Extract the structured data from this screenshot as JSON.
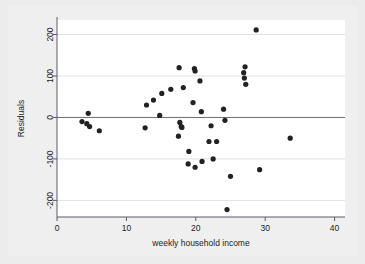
{
  "figure": {
    "background_color": "#ececec",
    "plot_background_color": "#ffffff",
    "point_color": "#222222",
    "grid_color": "#e2e2e2",
    "axis_color": "#5a5a6a",
    "zero_line_color": "#6b6b78"
  },
  "chart_data": {
    "type": "scatter",
    "title": "",
    "xlabel": "weekly household income",
    "ylabel": "Residuals",
    "xlim": [
      0,
      41.5
    ],
    "ylim": [
      -240,
      235
    ],
    "xticks": [
      0,
      10,
      20,
      30,
      40
    ],
    "xtick_labels": [
      "0",
      "10",
      "20",
      "30",
      "40"
    ],
    "yticks": [
      -200,
      -100,
      0,
      100,
      200
    ],
    "ytick_labels": [
      "-200",
      "-100",
      "0",
      "100",
      "200"
    ],
    "grid": true,
    "grid_axis": "y",
    "legend": false,
    "zero_reference_line": 0,
    "marker": "filled-circle",
    "marker_size": 2.6,
    "points": [
      {
        "x": 3.6,
        "y": -10
      },
      {
        "x": 4.5,
        "y": 10
      },
      {
        "x": 4.7,
        "y": -22
      },
      {
        "x": 4.3,
        "y": -15
      },
      {
        "x": 6.1,
        "y": -32
      },
      {
        "x": 12.7,
        "y": -25
      },
      {
        "x": 12.9,
        "y": 30
      },
      {
        "x": 13.9,
        "y": 42
      },
      {
        "x": 14.8,
        "y": 5
      },
      {
        "x": 15.1,
        "y": 58
      },
      {
        "x": 16.4,
        "y": 68
      },
      {
        "x": 17.6,
        "y": 120
      },
      {
        "x": 17.7,
        "y": -12
      },
      {
        "x": 17.9,
        "y": -22
      },
      {
        "x": 18.0,
        "y": -24
      },
      {
        "x": 17.5,
        "y": -45
      },
      {
        "x": 18.2,
        "y": 72
      },
      {
        "x": 19.0,
        "y": -82
      },
      {
        "x": 18.9,
        "y": -112
      },
      {
        "x": 19.8,
        "y": 118
      },
      {
        "x": 19.9,
        "y": 112
      },
      {
        "x": 19.6,
        "y": 36
      },
      {
        "x": 19.9,
        "y": -120
      },
      {
        "x": 20.6,
        "y": 88
      },
      {
        "x": 20.8,
        "y": 14
      },
      {
        "x": 20.9,
        "y": -106
      },
      {
        "x": 21.9,
        "y": -58
      },
      {
        "x": 22.2,
        "y": -20
      },
      {
        "x": 22.5,
        "y": -100
      },
      {
        "x": 23.0,
        "y": -58
      },
      {
        "x": 24.0,
        "y": 20
      },
      {
        "x": 24.2,
        "y": -7
      },
      {
        "x": 24.5,
        "y": -222
      },
      {
        "x": 25.0,
        "y": -142
      },
      {
        "x": 26.9,
        "y": 108
      },
      {
        "x": 27.0,
        "y": 95
      },
      {
        "x": 27.1,
        "y": 122
      },
      {
        "x": 27.2,
        "y": 80
      },
      {
        "x": 28.7,
        "y": 211
      },
      {
        "x": 29.2,
        "y": -126
      },
      {
        "x": 33.6,
        "y": -50
      }
    ]
  }
}
